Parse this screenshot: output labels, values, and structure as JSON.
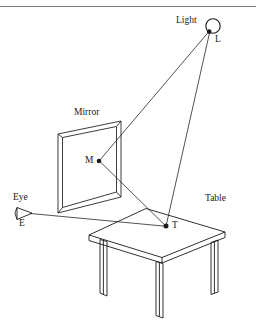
{
  "figure": {
    "type": "ray-diagram",
    "background_color": "#ffffff",
    "stroke_color": "#1a1a1a",
    "rule_color": "#7a7a7a"
  },
  "labels": {
    "light": "Light",
    "light_point": "L",
    "mirror": "Mirror",
    "mirror_point": "M",
    "eye": "Eye",
    "eye_point": "E",
    "table": "Table",
    "table_point": "T"
  },
  "geometry": {
    "light_bulb": {
      "cx": 213,
      "cy": 26,
      "r": 7
    },
    "points": {
      "L": {
        "x": 209,
        "y": 32
      },
      "M": {
        "x": 99,
        "y": 161
      },
      "T": {
        "x": 166,
        "y": 226
      },
      "E": {
        "x": 28,
        "y": 213
      }
    },
    "rays": [
      {
        "name": "L-to-M",
        "from": "L",
        "to": "M"
      },
      {
        "name": "L-to-T",
        "from": "L",
        "to": "T"
      },
      {
        "name": "M-to-T",
        "from": "M",
        "to": "T"
      },
      {
        "name": "E-to-T",
        "from": "E",
        "to": "T"
      }
    ]
  },
  "label_positions": {
    "light": {
      "x": 176,
      "y": 21
    },
    "light_point": {
      "x": 214,
      "y": 40
    },
    "mirror": {
      "x": 75,
      "y": 113
    },
    "mirror_point": {
      "x": 87,
      "y": 156
    },
    "eye": {
      "x": 14,
      "y": 198
    },
    "eye_point": {
      "x": 19,
      "y": 222
    },
    "table": {
      "x": 205,
      "y": 198
    },
    "table_point": {
      "x": 172,
      "y": 222
    }
  }
}
